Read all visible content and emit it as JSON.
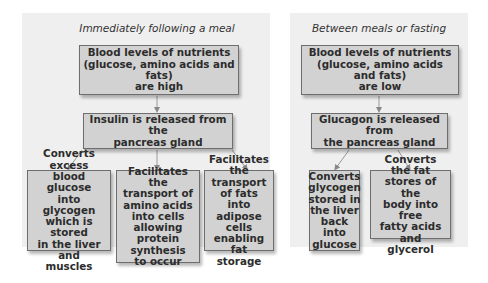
{
  "left_panel": {
    "title": "Immediately following a meal",
    "top_box": [
      "Blood levels of nutrients",
      "(glucose, amino acids and fats)",
      "are high"
    ],
    "hormone_box": [
      "Insulin is released from the",
      "pancreas gland"
    ],
    "effects": [
      [
        "Converts excess",
        "blood glucose",
        "into glycogen",
        "which is stored",
        "in the liver and",
        "muscles"
      ],
      [
        "Facilitates the",
        "transport of",
        "amino acids",
        "into cells",
        "allowing protein",
        "synthesis",
        "to occur"
      ],
      [
        "Facilitates",
        "the transport",
        "of fats into",
        "adipose cells",
        "enabling",
        "fat storage"
      ]
    ]
  },
  "right_panel": {
    "title": "Between meals or fasting",
    "top_box": [
      "Blood levels of nutrients",
      "(glucose, amino acids and fats)",
      "are low"
    ],
    "hormone_box": [
      "Glucagon is released from",
      "the pancreas gland"
    ],
    "effects": [
      [
        "Converts",
        "glycogen",
        "stored in",
        "the liver",
        "back into",
        "glucose"
      ],
      [
        "Converts the fat",
        "stores of the",
        "body into free",
        "fatty acids and",
        "glycerol"
      ]
    ]
  }
}
